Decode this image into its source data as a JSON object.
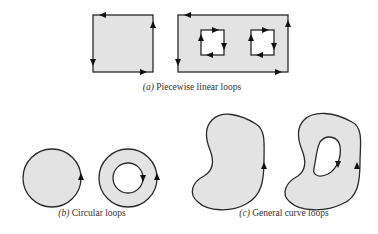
{
  "figure": {
    "panels": [
      {
        "id": "a",
        "label": "(a)",
        "caption": "Piecewise linear loops",
        "shapes": [
          "square-loop",
          "rectangle-loop-with-two-square-holes"
        ],
        "orientation": {
          "outer": "counterclockwise",
          "holes": "clockwise"
        }
      },
      {
        "id": "b",
        "label": "(b)",
        "caption": "Circular loops",
        "shapes": [
          "disk-loop",
          "annulus-loop"
        ],
        "orientation": {
          "outer": "counterclockwise",
          "holes": "clockwise"
        }
      },
      {
        "id": "c",
        "label": "(c)",
        "caption": "General curve loops",
        "shapes": [
          "blob-loop",
          "blob-loop-with-hole"
        ],
        "orientation": {
          "outer": "counterclockwise",
          "holes": "clockwise"
        }
      }
    ],
    "colors": {
      "region_fill": "#e3e3e3",
      "stroke": "#2a2a2a",
      "arrow": "#111111",
      "background": "#ffffff"
    }
  }
}
